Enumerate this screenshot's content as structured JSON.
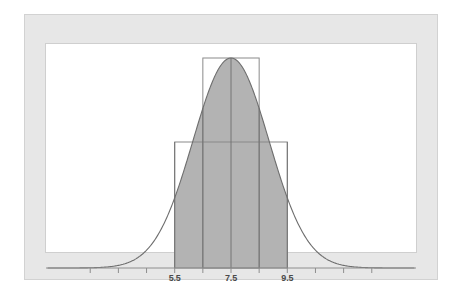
{
  "figure": {
    "background_color": "#ffffff",
    "frame_color": "#e7e7e7",
    "plot_background": "#ffffff",
    "curve_color": "#6e6e6e",
    "shade_color": "#b3b3b3",
    "rect_stroke_color": "#8a8a8a",
    "divider_color": "#6e6e6e",
    "axis_color": "#8e8e8e"
  },
  "chart_data": {
    "type": "area",
    "title": "",
    "subtitle": "",
    "xlabel": "",
    "ylabel": "",
    "grid": false,
    "legend": null,
    "distribution": {
      "name": "normal",
      "mean": 7.5,
      "std": 1.35,
      "peak_value": 1.0
    },
    "xlim": [
      1.0,
      14.0
    ],
    "ylim": [
      0,
      1.12
    ],
    "axis_ticks": [
      2.5,
      3.5,
      4.5,
      5.5,
      6.5,
      7.5,
      8.5,
      9.5,
      10.5,
      11.5,
      12.5
    ],
    "tick_labels": [
      "",
      "",
      "",
      "5.5",
      "",
      "7.5",
      "",
      "9.5",
      "",
      "",
      ""
    ],
    "visible_tick_labels": [
      {
        "value": 5.5,
        "text": "5.5"
      },
      {
        "value": 7.5,
        "text": "7.5"
      },
      {
        "value": 9.5,
        "text": "9.5"
      }
    ],
    "shaded_region": {
      "from": 5.5,
      "to": 9.5,
      "fill": "#b3b3b3"
    },
    "dividers": [
      5.5,
      6.5,
      7.5,
      8.5,
      9.5
    ],
    "rectangles": [
      {
        "name": "outer-rectangle",
        "x_from": 5.5,
        "x_to": 9.5,
        "height": 0.6
      },
      {
        "name": "inner-rectangle",
        "x_from": 6.5,
        "x_to": 8.5,
        "height": 1.0
      }
    ],
    "curve_points_x": [
      1.0,
      1.5,
      2.0,
      2.5,
      3.0,
      3.5,
      4.0,
      4.5,
      5.0,
      5.5,
      6.0,
      6.5,
      7.0,
      7.5,
      8.0,
      8.5,
      9.0,
      9.5,
      10.0,
      10.5,
      11.0,
      11.5,
      12.0,
      12.5,
      13.0,
      13.5,
      14.0
    ],
    "curve_points_y": [
      0.0,
      0.001,
      0.002,
      0.006,
      0.016,
      0.038,
      0.081,
      0.155,
      0.265,
      0.406,
      0.558,
      0.705,
      0.85,
      1.0,
      0.85,
      0.705,
      0.558,
      0.406,
      0.265,
      0.155,
      0.081,
      0.038,
      0.016,
      0.006,
      0.002,
      0.001,
      0.0
    ]
  }
}
